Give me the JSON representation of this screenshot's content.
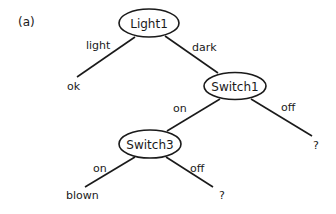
{
  "figure": {
    "panel_label": "(a)",
    "nodes": {
      "root": {
        "label": "Light1"
      },
      "switch1": {
        "label": "Switch1"
      },
      "switch3": {
        "label": "Switch3"
      }
    },
    "edges": {
      "root_light": "light",
      "root_dark": "dark",
      "switch1_on": "on",
      "switch1_off": "off",
      "switch3_on": "on",
      "switch3_off": "off"
    },
    "leaves": {
      "light_leaf": "ok",
      "switch1_off_leaf": "?",
      "switch3_on_leaf": "blown",
      "switch3_off_leaf": "?"
    }
  }
}
